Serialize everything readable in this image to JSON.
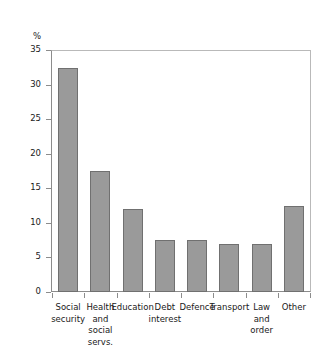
{
  "chart_data": {
    "type": "bar",
    "title": "",
    "subtitle": "",
    "xlabel": "",
    "ylabel": "%",
    "unit_label": "%",
    "categories": [
      "Social security",
      "Health and social servs.",
      "Education",
      "Debt interest",
      "Defence",
      "Transport",
      "Law and order",
      "Other"
    ],
    "category_lines": [
      [
        "Social",
        "security"
      ],
      [
        "Health",
        "and",
        "social",
        "servs."
      ],
      [
        "Education"
      ],
      [
        "Debt",
        "interest"
      ],
      [
        "Defence"
      ],
      [
        "Transport"
      ],
      [
        "Law",
        "and",
        "order"
      ],
      [
        "Other"
      ]
    ],
    "values": [
      32.4,
      17.5,
      12.0,
      7.5,
      7.5,
      7.0,
      7.0,
      12.4
    ],
    "ylim": [
      0,
      35
    ],
    "ytick_step": 5,
    "yticks": [
      0,
      5,
      10,
      15,
      20,
      25,
      30,
      35
    ],
    "ytick_labels": [
      "0",
      "5",
      "10",
      "15",
      "20",
      "25",
      "30",
      "35"
    ],
    "grid": false,
    "legend": null,
    "legend_position": "none",
    "colors": {
      "bar_fill": "#9a9a9a",
      "bar_border": "#707070",
      "axis": "#8c8c8c",
      "frame": "#b9b9b9",
      "text": "#1a1a1a",
      "background": "#ffffff"
    }
  }
}
